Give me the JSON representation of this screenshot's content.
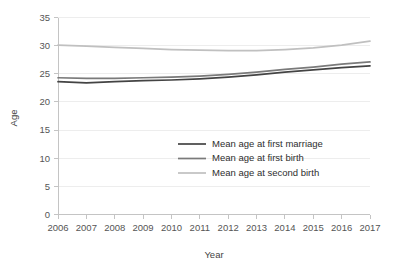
{
  "chart_data": {
    "type": "line",
    "title": "",
    "xlabel": "Year",
    "ylabel": "Age",
    "grid": true,
    "legend_position": "center",
    "categories": [
      "2006",
      "2007",
      "2008",
      "2009",
      "2010",
      "2011",
      "2012",
      "2013",
      "2014",
      "2015",
      "2016",
      "2017"
    ],
    "x": [
      2006,
      2007,
      2008,
      2009,
      2010,
      2011,
      2012,
      2013,
      2014,
      2015,
      2016,
      2017
    ],
    "xlim": [
      2006,
      2017
    ],
    "ylim": [
      0,
      35
    ],
    "yticks": [
      0,
      5,
      10,
      15,
      20,
      25,
      30,
      35
    ],
    "ytick_labels": [
      "0",
      "5",
      "10",
      "15",
      "20",
      "25",
      "30",
      "35"
    ],
    "series": [
      {
        "name": "Mean age at first marriage",
        "color": "#444444",
        "values": [
          23.6,
          23.4,
          23.6,
          23.8,
          23.9,
          24.1,
          24.4,
          24.8,
          25.3,
          25.7,
          26.1,
          26.4
        ]
      },
      {
        "name": "Mean age at first birth",
        "color": "#7a7a7a",
        "values": [
          24.3,
          24.2,
          24.2,
          24.3,
          24.4,
          24.6,
          24.9,
          25.3,
          25.8,
          26.2,
          26.7,
          27.1
        ]
      },
      {
        "name": "Mean age at second birth",
        "color": "#c0c0c0",
        "values": [
          30.1,
          29.9,
          29.7,
          29.5,
          29.3,
          29.2,
          29.1,
          29.1,
          29.3,
          29.6,
          30.1,
          30.8
        ]
      }
    ]
  },
  "legend": {
    "items": [
      {
        "label": "Mean age at first marriage",
        "color": "#444444"
      },
      {
        "label": "Mean age at first birth",
        "color": "#7a7a7a"
      },
      {
        "label": "Mean age at second birth",
        "color": "#c0c0c0"
      }
    ]
  },
  "axes": {
    "y_title": "Age",
    "x_title": "Year"
  }
}
